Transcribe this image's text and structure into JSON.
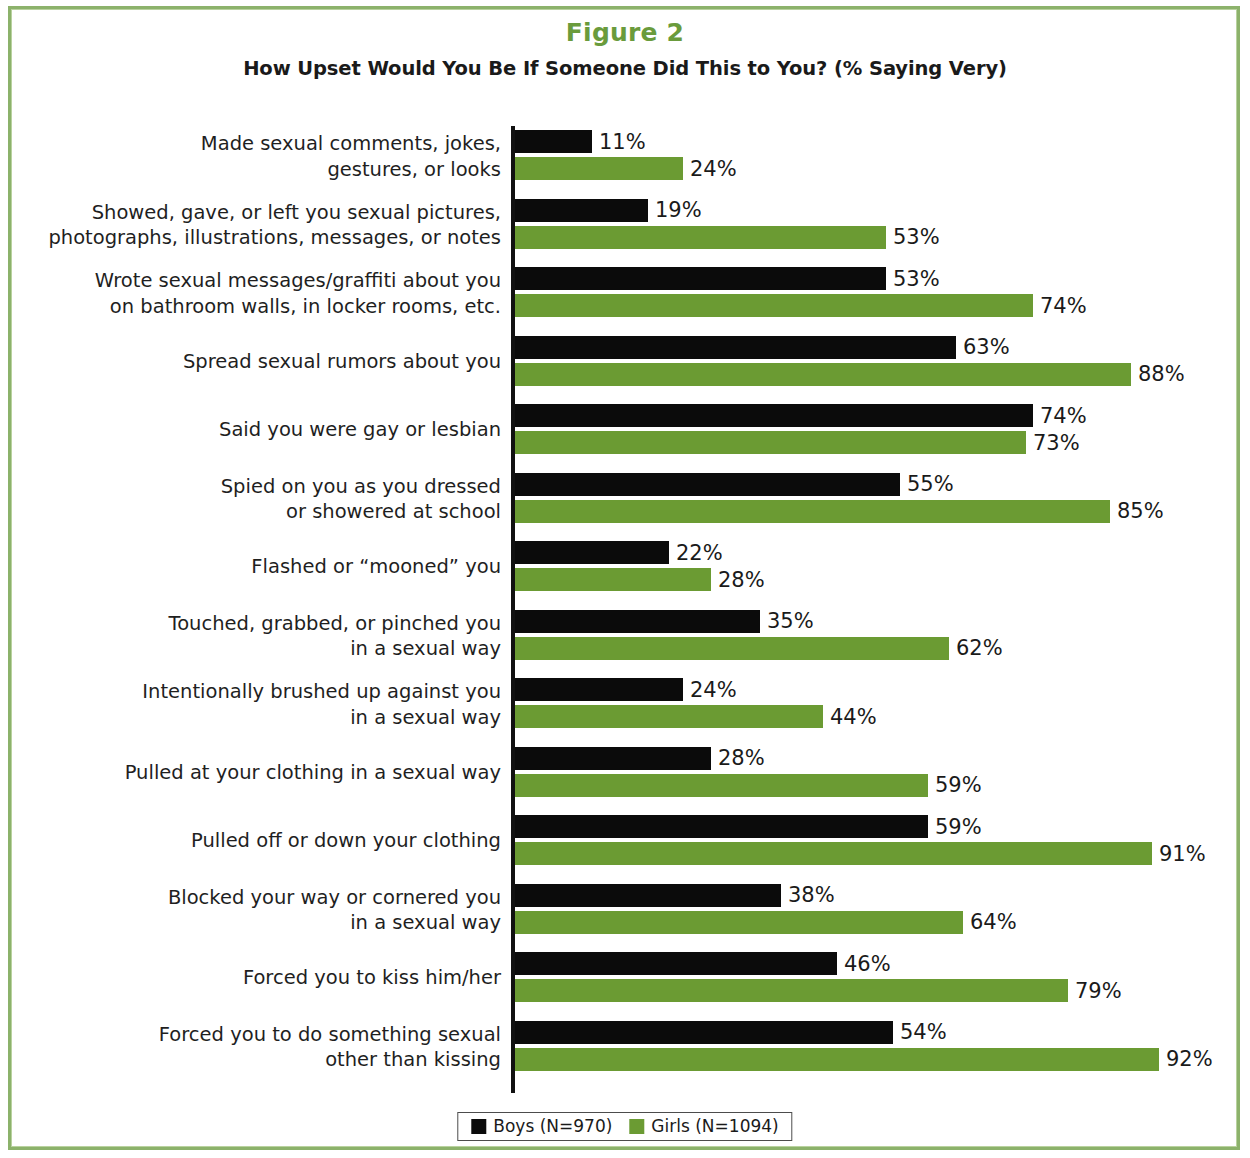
{
  "figure": {
    "label": "Figure 2",
    "subtitle": "How Upset Would You Be If Someone Did This to You? (% Saying Very)"
  },
  "colors": {
    "boys": "#0B0B0B",
    "girls": "#6B9B33",
    "frame": "#8CB26B",
    "figure_label": "#6A9B3C"
  },
  "legend": {
    "boys_label": "Boys (N=970)",
    "girls_label": "Girls (N=1094)"
  },
  "chart_data": {
    "type": "bar",
    "orientation": "horizontal",
    "title": "Figure 2",
    "subtitle": "How Upset Would You Be If Someone Did This to You? (% Saying Very)",
    "xlabel": "",
    "ylabel": "",
    "xlim": [
      0,
      100
    ],
    "grid": false,
    "legend_position": "bottom",
    "value_suffix": "%",
    "categories": [
      "Made sexual comments, jokes,\ngestures, or looks",
      "Showed, gave, or left you sexual pictures,\nphotographs, illustrations, messages, or notes",
      "Wrote sexual messages/graffiti about you\non bathroom walls, in locker rooms, etc.",
      "Spread sexual rumors about you",
      "Said you were gay or lesbian",
      "Spied on you as you dressed\nor showered at school",
      "Flashed or “mooned” you",
      "Touched, grabbed, or pinched you\nin a sexual way",
      "Intentionally brushed up against you\nin a sexual way",
      "Pulled at your clothing in a sexual way",
      "Pulled off or down your clothing",
      "Blocked your way or cornered you\nin a sexual way",
      "Forced you to kiss him/her",
      "Forced you to do something sexual\nother than kissing"
    ],
    "series": [
      {
        "name": "Boys (N=970)",
        "color": "#0B0B0B",
        "values": [
          11,
          19,
          53,
          63,
          74,
          55,
          22,
          35,
          24,
          28,
          59,
          38,
          46,
          54
        ],
        "labels": [
          "11%",
          "19%",
          "53%",
          "63%",
          "74%",
          "55%",
          "22%",
          "35%",
          "24%",
          "28%",
          "59%",
          "38%",
          "46%",
          "54%"
        ]
      },
      {
        "name": "Girls (N=1094)",
        "color": "#6B9B33",
        "values": [
          24,
          53,
          74,
          88,
          73,
          85,
          28,
          62,
          44,
          59,
          91,
          64,
          79,
          92
        ],
        "labels": [
          "24%",
          "53%",
          "74%",
          "88%",
          "73%",
          "85%",
          "28%",
          "62%",
          "44%",
          "59%",
          "91%",
          "64%",
          "79%",
          "92%"
        ]
      }
    ]
  }
}
